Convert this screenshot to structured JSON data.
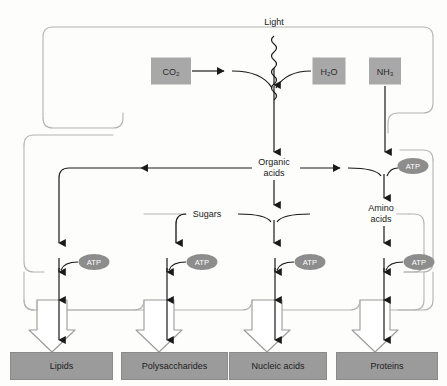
{
  "diagram": {
    "colors": {
      "reactant_fill": "#a8a8a8",
      "product_fill": "#9b9b9b",
      "atp_fill": "#8d8d8d",
      "arrow_stroke": "#1a1a1a",
      "membrane_stroke": "#b4b4b4",
      "hollow_arrow_stroke": "#9a9a9a",
      "background": "#fdfdfc"
    },
    "energy_source": {
      "label": "Light",
      "icon": "wavy-photon-arrow"
    },
    "reactants": [
      {
        "id": "co2",
        "label": "CO",
        "sub": "2"
      },
      {
        "id": "h2o",
        "label": "H",
        "sub": "2",
        "label_tail": "O"
      },
      {
        "id": "nh3",
        "label": "NH",
        "sub": "3"
      }
    ],
    "reactant_display": {
      "co2": "CO₂",
      "h2o": "H₂O",
      "nh3": "NH₃"
    },
    "intermediates": [
      {
        "id": "organic-acids",
        "label": "Organic\nacids"
      },
      {
        "id": "sugars",
        "label": "Sugars"
      },
      {
        "id": "amino-acids",
        "label": "Amino\nacids"
      }
    ],
    "cofactors": [
      {
        "id": "atp-amino-acids",
        "label": "ATP"
      },
      {
        "id": "atp-lipids",
        "label": "ATP"
      },
      {
        "id": "atp-polysaccharides",
        "label": "ATP"
      },
      {
        "id": "atp-nucleic-acids",
        "label": "ATP"
      },
      {
        "id": "atp-proteins",
        "label": "ATP"
      }
    ],
    "products": [
      {
        "id": "lipids",
        "label": "Lipids"
      },
      {
        "id": "polysaccharides",
        "label": "Polysaccharides"
      },
      {
        "id": "nucleic-acids",
        "label": "Nucleic acids"
      },
      {
        "id": "proteins",
        "label": "Proteins"
      }
    ]
  }
}
